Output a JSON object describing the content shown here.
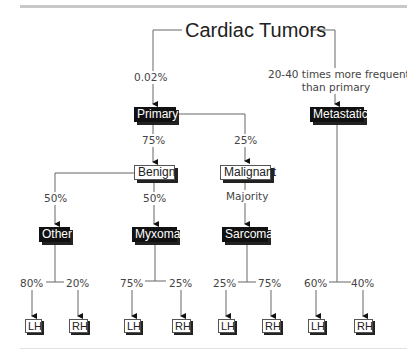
{
  "title": "Cardiac Tumors",
  "edges": {
    "to_primary": "0.02%",
    "to_metastatic": "20-40 times more frequent than primary",
    "to_metastatic_line1": "20-40 times more frequent",
    "to_metastatic_line2": "than primary",
    "primary_to_benign": "75%",
    "primary_to_malignant": "25%",
    "benign_to_other": "50%",
    "benign_to_myxoma": "50%",
    "malignant_to_sarcoma": "Majority"
  },
  "nodes": {
    "primary": "Primary",
    "metastatic": "Metastatic",
    "benign": "Benign",
    "malignant": "Malignant",
    "other": "Other",
    "myxoma": "Myxoma",
    "sarcoma": "Sarcoma"
  },
  "leaf_groups": [
    {
      "parent": "Other",
      "left_pct": "80%",
      "right_pct": "20%",
      "left_label": "LH",
      "right_label": "RH"
    },
    {
      "parent": "Myxoma",
      "left_pct": "75%",
      "right_pct": "25%",
      "left_label": "LH",
      "right_label": "RH"
    },
    {
      "parent": "Sarcoma",
      "left_pct": "25%",
      "right_pct": "75%",
      "left_label": "LH",
      "right_label": "RH"
    },
    {
      "parent": "Metastatic",
      "left_pct": "60%",
      "right_pct": "40%",
      "left_label": "LH",
      "right_label": "RH"
    }
  ],
  "colors": {
    "dark_box": "#111111",
    "line": "#555555",
    "text": "#444444"
  }
}
